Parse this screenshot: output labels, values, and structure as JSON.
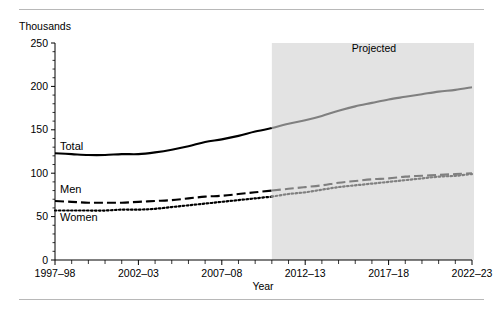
{
  "chart_data": {
    "type": "line",
    "title": "",
    "unit_label": "Thousands",
    "xlabel": "Year",
    "ylabel": "",
    "xlim": [
      1997,
      2022
    ],
    "ylim": [
      0,
      250
    ],
    "yticks": [
      0,
      50,
      100,
      150,
      200,
      250
    ],
    "ytick_labels": [
      "0",
      "50",
      "100",
      "150",
      "200",
      "250"
    ],
    "xtick_labels": [
      "1997–98",
      "2002–03",
      "2007–08",
      "2012–13",
      "2017–18",
      "2022–23"
    ],
    "xtick_values": [
      1997,
      2002,
      2007,
      2012,
      2017,
      2022
    ],
    "minor_ticks_every": 1,
    "grid": false,
    "legend": "inline-labels",
    "x": [
      1997,
      1998,
      1999,
      2000,
      2001,
      2002,
      2003,
      2004,
      2005,
      2006,
      2007,
      2008,
      2009,
      2010,
      2011,
      2012,
      2013,
      2014,
      2015,
      2016,
      2017,
      2018,
      2019,
      2020,
      2021,
      2022
    ],
    "series": [
      {
        "name": "Total",
        "style": "solid",
        "label": "Total",
        "color": "#000000",
        "projected_color": "#808080",
        "values": [
          123,
          122,
          121,
          121,
          122,
          122,
          124,
          127,
          131,
          136,
          139,
          143,
          148,
          152,
          157,
          161,
          166,
          172,
          177,
          181,
          185,
          188,
          191,
          194,
          196,
          199
        ]
      },
      {
        "name": "Men",
        "style": "dashed",
        "label": "Men",
        "color": "#000000",
        "projected_color": "#808080",
        "values": [
          68,
          67,
          66,
          66,
          66,
          67,
          68,
          69,
          71,
          73,
          74,
          76,
          78,
          80,
          82,
          84,
          86,
          89,
          91,
          93,
          94,
          96,
          97,
          98,
          99,
          100
        ]
      },
      {
        "name": "Women",
        "style": "dotted",
        "label": "Women",
        "color": "#000000",
        "projected_color": "#808080",
        "values": [
          57,
          57,
          57,
          57,
          58,
          58,
          59,
          61,
          63,
          65,
          67,
          69,
          71,
          73,
          76,
          78,
          81,
          84,
          86,
          88,
          90,
          92,
          94,
          96,
          97,
          99
        ]
      }
    ],
    "annotations": [
      {
        "name": "projected-band",
        "label": "Projected",
        "x_start": 2010,
        "x_end": 2022,
        "fill": "#e3e3e3"
      }
    ],
    "projection_start_year": 2010
  }
}
